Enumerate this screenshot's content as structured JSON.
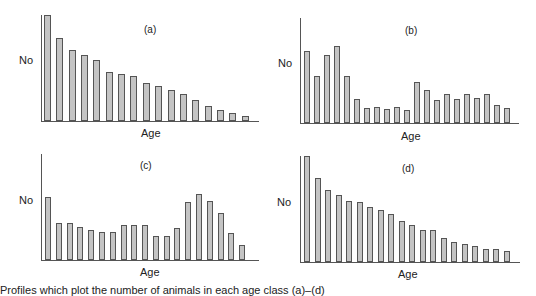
{
  "chart_data": [
    {
      "type": "bar",
      "title": "(a)",
      "xlabel": "Age",
      "ylabel": "No",
      "grid": false,
      "categories": [
        "1",
        "2",
        "3",
        "4",
        "5",
        "6",
        "7",
        "8",
        "9",
        "10",
        "11",
        "12",
        "13",
        "14",
        "15",
        "16",
        "17"
      ],
      "values": [
        100,
        78,
        67,
        62,
        58,
        46,
        44,
        42,
        36,
        33,
        29,
        25,
        20,
        14,
        10,
        8,
        5
      ],
      "ylim": [
        0,
        100
      ]
    },
    {
      "type": "bar",
      "title": "(b)",
      "xlabel": "Age",
      "ylabel": "No",
      "grid": false,
      "categories": [
        "1",
        "2",
        "3",
        "4",
        "5",
        "6",
        "7",
        "8",
        "9",
        "10",
        "11",
        "12",
        "13",
        "14",
        "15",
        "16",
        "17",
        "18",
        "19",
        "20",
        "21"
      ],
      "values": [
        69,
        45,
        65,
        73,
        45,
        23,
        14,
        15,
        13,
        15,
        12,
        39,
        31,
        22,
        28,
        23,
        28,
        24,
        28,
        17,
        14
      ],
      "ylim": [
        0,
        100
      ]
    },
    {
      "type": "bar",
      "title": "(c)",
      "xlabel": "Age",
      "ylabel": "No",
      "grid": false,
      "categories": [
        "1",
        "2",
        "3",
        "4",
        "5",
        "6",
        "7",
        "8",
        "9",
        "10",
        "11",
        "12",
        "13",
        "14",
        "15",
        "16",
        "17",
        "18",
        "19"
      ],
      "values": [
        59,
        35,
        35,
        31,
        28,
        26,
        26,
        33,
        33,
        33,
        23,
        23,
        30,
        55,
        62,
        56,
        44,
        25,
        14
      ],
      "ylim": [
        0,
        100
      ]
    },
    {
      "type": "bar",
      "title": "(d)",
      "xlabel": "Age",
      "ylabel": "No",
      "grid": false,
      "categories": [
        "1",
        "2",
        "3",
        "4",
        "5",
        "6",
        "7",
        "8",
        "9",
        "10",
        "11",
        "12",
        "13",
        "14",
        "15",
        "16",
        "17",
        "18",
        "19",
        "20"
      ],
      "values": [
        100,
        79,
        68,
        63,
        58,
        57,
        52,
        49,
        45,
        39,
        35,
        30,
        30,
        23,
        19,
        17,
        15,
        12,
        12,
        10
      ],
      "ylim": [
        0,
        100
      ]
    }
  ],
  "panels": [
    {
      "label": "(a)",
      "ylabel": "No",
      "xlabel": "Age"
    },
    {
      "label": "(b)",
      "ylabel": "No",
      "xlabel": "Age"
    },
    {
      "label": "(c)",
      "ylabel": "No",
      "xlabel": "Age"
    },
    {
      "label": "(d)",
      "ylabel": "No",
      "xlabel": "Age"
    }
  ],
  "caption": "Profiles which plot the number of animals in each age class (a)–(d)"
}
